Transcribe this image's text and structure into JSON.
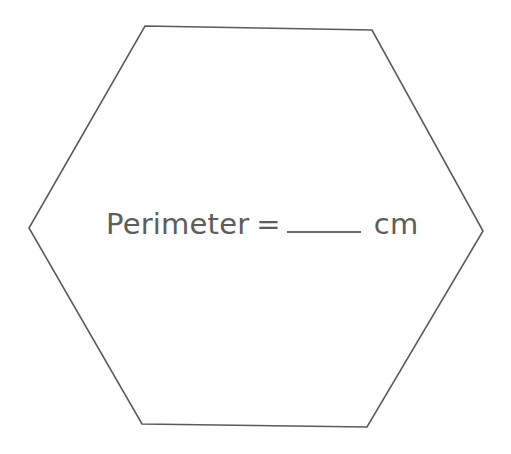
{
  "page": {
    "background_color": "#ffffff",
    "width": 511,
    "height": 454
  },
  "shape": {
    "name": "hexagon",
    "sides": 6,
    "stroke_color": "#5b5b5b",
    "fill_color": "none",
    "stroke_width": 1.6,
    "points": "145,26 372,30 483,231 367,427 142,424 29,228"
  },
  "question": {
    "label": "Perimeter",
    "equals_sign": "=",
    "answer_value": "",
    "answer_placeholder": "",
    "unit": "cm",
    "text_color": "#5d5d5d",
    "blank_line_color": "#6a6a6a"
  }
}
